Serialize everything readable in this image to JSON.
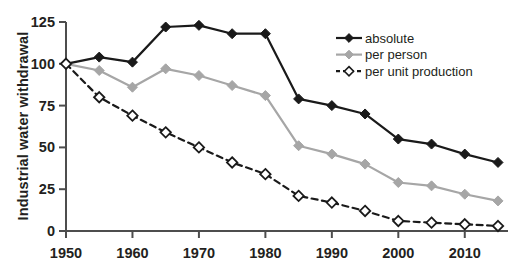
{
  "axis": {
    "ylabel": "Industrial water withdrawal",
    "yticks": [
      "0",
      "25",
      "50",
      "75",
      "100",
      "125"
    ],
    "xticks": [
      "1950",
      "1960",
      "1970",
      "1980",
      "1990",
      "2000",
      "2010"
    ]
  },
  "legend": {
    "items": [
      {
        "label": "absolute",
        "color": "#1a1a1a",
        "style": "solid",
        "marker": "filled-diamond"
      },
      {
        "label": "per person",
        "color": "#a6a6a6",
        "style": "solid",
        "marker": "filled-diamond"
      },
      {
        "label": "per unit production",
        "color": "#1a1a1a",
        "style": "dashed",
        "marker": "hollow-diamond"
      }
    ]
  },
  "chart_data": {
    "type": "line",
    "title": "",
    "xlabel": "",
    "ylabel": "Industrial water withdrawal",
    "xlim": [
      1950,
      2015
    ],
    "ylim": [
      0,
      125
    ],
    "grid": false,
    "legend_position": "upper-right-inside",
    "x": [
      1950,
      1955,
      1960,
      1965,
      1970,
      1975,
      1980,
      1985,
      1990,
      1995,
      2000,
      2005,
      2010,
      2015
    ],
    "series": [
      {
        "name": "absolute",
        "color": "#1a1a1a",
        "style": "solid",
        "marker": "filled-diamond",
        "values": [
          100,
          104,
          101,
          122,
          123,
          118,
          118,
          79,
          75,
          70,
          55,
          52,
          46,
          41
        ]
      },
      {
        "name": "per person",
        "color": "#a6a6a6",
        "style": "solid",
        "marker": "filled-diamond",
        "values": [
          100,
          96,
          86,
          97,
          93,
          87,
          81,
          51,
          46,
          40,
          29,
          27,
          22,
          18
        ]
      },
      {
        "name": "per unit production",
        "color": "#1a1a1a",
        "style": "dashed",
        "marker": "hollow-diamond",
        "values": [
          100,
          80,
          69,
          59,
          50,
          41,
          34,
          21,
          17,
          12,
          6,
          5,
          4,
          3
        ]
      }
    ]
  }
}
